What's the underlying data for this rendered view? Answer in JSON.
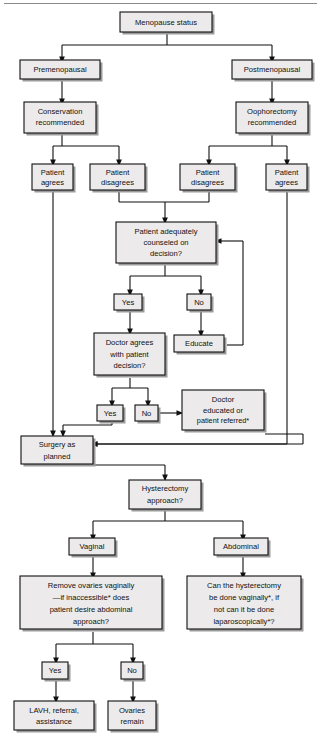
{
  "figure": {
    "type": "flowchart",
    "colors": {
      "box_fill": "#eceaea",
      "box_stroke": "#101010",
      "connector": "#101010",
      "shadow": "#9b9b9b",
      "top_rule": "#8a8a8a",
      "background": "#ffffff"
    }
  },
  "nodes": {
    "menopause_status": "Menopause status",
    "premenopausal": "Premenopausal",
    "postmenopausal": "Postmenopausal",
    "conservation_line1": "Conservation",
    "conservation_line2": "recommended",
    "oophorectomy_line1": "Oophorectomy",
    "oophorectomy_line2": "recommended",
    "patient_agrees_left_line1": "Patient",
    "patient_agrees_left_line2": "agrees",
    "patient_disagrees_left_line1": "Patient",
    "patient_disagrees_left_line2": "disagrees",
    "patient_disagrees_right_line1": "Patient",
    "patient_disagrees_right_line2": "disagrees",
    "patient_agrees_right_line1": "Patient",
    "patient_agrees_right_line2": "agrees",
    "counseled_line1": "Patient adequately",
    "counseled_line2": "counseled on",
    "counseled_line3": "decision?",
    "counseled_yes": "Yes",
    "counseled_no": "No",
    "educate": "Educate",
    "doctor_agrees_line1": "Doctor agrees",
    "doctor_agrees_line2": "with patient",
    "doctor_agrees_line3": "decision?",
    "doctor_yes": "Yes",
    "doctor_no": "No",
    "doctor_educated_line1": "Doctor",
    "doctor_educated_line2": "educated or",
    "doctor_educated_line3": "patient referred*",
    "surgery_line1": "Surgery as",
    "surgery_line2": "planned",
    "hysterectomy_line1": "Hysterectomy",
    "hysterectomy_line2": "approach?",
    "vaginal": "Vaginal",
    "abdominal": "Abdominal",
    "remove_ovaries_line1": "Remove ovaries vaginally",
    "remove_ovaries_line2": "—if inaccessible* does",
    "remove_ovaries_line3": "patient desire abdominal",
    "remove_ovaries_line4": "approach?",
    "can_hyst_line1": "Can the hysterectomy",
    "can_hyst_line2": "be done vaginally*, if",
    "can_hyst_line3": "not can it be done",
    "can_hyst_line4": "laparoscopically*?",
    "ovaries_yes": "Yes",
    "ovaries_no": "No",
    "lavh_line1": "LAVH, referral,",
    "lavh_line2": "assistance",
    "ovaries_remain_line1": "Ovaries",
    "ovaries_remain_line2": "remain"
  },
  "edges": [
    {
      "from": "menopause_status",
      "to": "premenopausal",
      "label": ""
    },
    {
      "from": "menopause_status",
      "to": "postmenopausal",
      "label": ""
    },
    {
      "from": "premenopausal",
      "to": "conservation",
      "label": ""
    },
    {
      "from": "postmenopausal",
      "to": "oophorectomy",
      "label": ""
    },
    {
      "from": "conservation",
      "to": "patient_agrees_left",
      "label": ""
    },
    {
      "from": "conservation",
      "to": "patient_disagrees_left",
      "label": ""
    },
    {
      "from": "oophorectomy",
      "to": "patient_disagrees_right",
      "label": ""
    },
    {
      "from": "oophorectomy",
      "to": "patient_agrees_right",
      "label": ""
    },
    {
      "from": "patient_disagrees_left",
      "to": "counseled",
      "label": ""
    },
    {
      "from": "patient_disagrees_right",
      "to": "counseled",
      "label": ""
    },
    {
      "from": "counseled",
      "to": "counseled_yes",
      "label": "Yes"
    },
    {
      "from": "counseled",
      "to": "counseled_no",
      "label": "No"
    },
    {
      "from": "counseled_no",
      "to": "educate",
      "label": ""
    },
    {
      "from": "educate",
      "to": "counseled",
      "label": ""
    },
    {
      "from": "counseled_yes",
      "to": "doctor_agrees",
      "label": ""
    },
    {
      "from": "doctor_agrees",
      "to": "doctor_yes",
      "label": "Yes"
    },
    {
      "from": "doctor_agrees",
      "to": "doctor_no",
      "label": "No"
    },
    {
      "from": "doctor_no",
      "to": "doctor_educated",
      "label": ""
    },
    {
      "from": "doctor_educated",
      "to": "surgery",
      "label": ""
    },
    {
      "from": "doctor_yes",
      "to": "surgery",
      "label": ""
    },
    {
      "from": "patient_agrees_left",
      "to": "surgery",
      "label": ""
    },
    {
      "from": "patient_agrees_right",
      "to": "surgery",
      "label": ""
    },
    {
      "from": "surgery",
      "to": "hysterectomy",
      "label": ""
    },
    {
      "from": "hysterectomy",
      "to": "vaginal",
      "label": ""
    },
    {
      "from": "hysterectomy",
      "to": "abdominal",
      "label": ""
    },
    {
      "from": "vaginal",
      "to": "remove_ovaries",
      "label": ""
    },
    {
      "from": "abdominal",
      "to": "can_hyst",
      "label": ""
    },
    {
      "from": "remove_ovaries",
      "to": "ovaries_yes",
      "label": "Yes"
    },
    {
      "from": "remove_ovaries",
      "to": "ovaries_no",
      "label": "No"
    },
    {
      "from": "ovaries_yes",
      "to": "lavh",
      "label": ""
    },
    {
      "from": "ovaries_no",
      "to": "ovaries_remain",
      "label": ""
    }
  ]
}
